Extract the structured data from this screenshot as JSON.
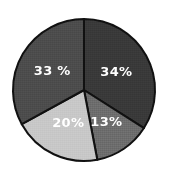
{
  "chart_data": {
    "type": "pie",
    "title": "",
    "subtitle": "",
    "xlabel": "",
    "ylabel": "",
    "legend": "none",
    "grid": false,
    "categories": [
      "Segment 1",
      "Segment 2",
      "Segment 3",
      "Segment 4"
    ],
    "values": [
      34,
      13,
      20,
      33
    ],
    "labels": [
      "34%",
      "13%",
      "20%",
      "33 %"
    ],
    "colors": [
      "#3a3a3a",
      "#6e6e6e",
      "#c8c8c8",
      "#4d4d4d"
    ],
    "label_color": "#ffffff",
    "outline_color": "#111111",
    "background_color": "#ffffff",
    "start_angle_deg": 0,
    "direction": "clockwise",
    "slices": [
      {
        "label": "34%",
        "value": 34,
        "color": "#3a3a3a",
        "position": "upper-right"
      },
      {
        "label": "13%",
        "value": 13,
        "color": "#6e6e6e",
        "position": "lower-right"
      },
      {
        "label": "20%",
        "value": 20,
        "color": "#c8c8c8",
        "position": "lower-left"
      },
      {
        "label": "33 %",
        "value": 33,
        "color": "#4d4d4d",
        "position": "upper-left"
      }
    ]
  },
  "geometry": {
    "center_x": 84,
    "center_y": 90,
    "radius": 71
  }
}
